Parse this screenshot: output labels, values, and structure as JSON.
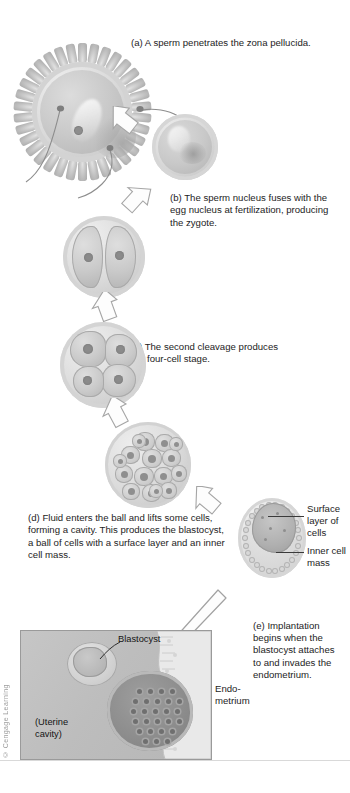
{
  "figure": {
    "credit": "© Cengage Learning",
    "palette": {
      "background": "#ffffff",
      "text": "#1a1a1a",
      "cell_light": "#dcdcdc",
      "cell_mid": "#c2c2c2",
      "cell_dark": "#8d8d8d",
      "panel_bg": "#bdbdbd",
      "leader_line": "#3a3a3a"
    }
  },
  "captions": {
    "a": "(a) A sperm penetrates the zona pellucida.",
    "b": "(b) The sperm nucleus fuses with the egg nucleus at fertilization, producing the zygote.",
    "c": "(c) The second cleavage produces the four-cell stage.",
    "d": "(d) Fluid enters the ball and lifts some cells, forming a cavity. This produces the blastocyst, a ball of cells with a surface layer and an inner cell mass.",
    "e": "(e) Implantation begins when the blastocyst attaches to and invades the endometrium."
  },
  "labels": {
    "surface_layer": "Surface layer of cells",
    "inner_cell_mass": "Inner cell mass",
    "blastocyst": "Blastocyst",
    "endometrium": "Endo-\nmetrium",
    "endometrium_line1": "Endo-",
    "endometrium_line2": "metrium",
    "uterine_cavity_line1": "(Uterine",
    "uterine_cavity_line2": "cavity)"
  },
  "stages": [
    {
      "key": "egg-sperm",
      "name": "Secondary oocyte with corona radiata and sperm",
      "order": 1
    },
    {
      "key": "zygote",
      "name": "Zygote (fertilized egg)",
      "order": 2
    },
    {
      "key": "two-cell",
      "name": "Two-cell stage",
      "order": 3,
      "cells": 2
    },
    {
      "key": "four-cell",
      "name": "Four-cell stage",
      "order": 4,
      "cells": 4
    },
    {
      "key": "morula",
      "name": "Morula",
      "order": 5,
      "cells": 16
    },
    {
      "key": "blastocyst",
      "name": "Blastocyst",
      "order": 6
    },
    {
      "key": "implantation",
      "name": "Implantation in the endometrium",
      "order": 7
    }
  ]
}
